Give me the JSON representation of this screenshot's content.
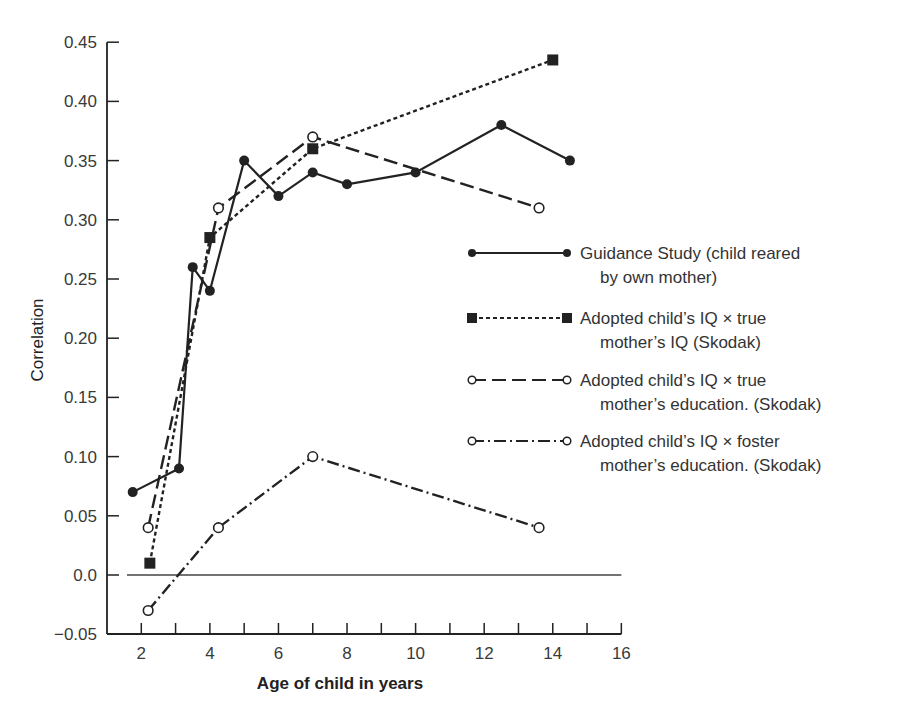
{
  "chart_data": {
    "type": "line",
    "title": "",
    "xlabel": "Age of child in years",
    "ylabel": "Correlation",
    "xlim": [
      1,
      16
    ],
    "ylim": [
      -0.05,
      0.45
    ],
    "x_ticks": [
      2,
      4,
      6,
      8,
      10,
      12,
      14,
      16
    ],
    "x_minor_ticks": [
      2,
      3,
      4,
      5,
      6,
      7,
      8,
      9,
      10,
      11,
      12,
      13,
      14,
      15,
      16
    ],
    "y_ticks": [
      -0.05,
      0.0,
      0.05,
      0.1,
      0.15,
      0.2,
      0.25,
      0.3,
      0.35,
      0.4,
      0.45
    ],
    "y_tick_labels": [
      "−0.05",
      "0.0",
      "0.05",
      "0.10",
      "0.15",
      "0.20",
      "0.25",
      "0.30",
      "0.35",
      "0.40",
      "0.45"
    ],
    "x_tick_labels": [
      "2",
      "4",
      "6",
      "8",
      "10",
      "12",
      "14",
      "16"
    ],
    "grid": false,
    "reference_line": {
      "y": 0.0,
      "style": "solid"
    },
    "legend_position": "right",
    "series": [
      {
        "name": "Guidance Study (child reared by own mother)",
        "legend_lines": [
          "Guidance Study (child reared",
          "by own mother)"
        ],
        "marker": "filled-circle",
        "line_style": "solid",
        "x": [
          1.75,
          3.1,
          3.5,
          4.0,
          5.0,
          6.0,
          7.0,
          8.0,
          10.0,
          12.5,
          14.5
        ],
        "values": [
          0.07,
          0.09,
          0.26,
          0.24,
          0.35,
          0.32,
          0.34,
          0.33,
          0.34,
          0.38,
          0.35
        ]
      },
      {
        "name": "Adopted child's IQ X true mother's IQ (Skodak)",
        "legend_lines": [
          "Adopted child’s IQ × true",
          "mother’s IQ (Skodak)"
        ],
        "marker": "filled-square",
        "line_style": "dotted",
        "x": [
          2.25,
          4.0,
          7.0,
          14.0
        ],
        "values": [
          0.01,
          0.285,
          0.36,
          0.435
        ]
      },
      {
        "name": "Adopted child's IQ X true mother's education. (Skodak)",
        "legend_lines": [
          "Adopted child’s IQ × true",
          "mother’s education. (Skodak)"
        ],
        "marker": "open-circle",
        "line_style": "dashed",
        "x": [
          2.2,
          4.25,
          7.0,
          13.6
        ],
        "values": [
          0.04,
          0.31,
          0.37,
          0.31
        ]
      },
      {
        "name": "Adopted child's IQ X foster mother's education. (Skodak)",
        "legend_lines": [
          "Adopted child’s IQ × foster",
          "mother’s education. (Skodak)"
        ],
        "marker": "open-circle",
        "line_style": "dash-dot",
        "x": [
          2.2,
          4.25,
          7.0,
          13.6
        ],
        "values": [
          -0.03,
          0.04,
          0.1,
          0.04
        ]
      }
    ]
  },
  "style": {
    "ink": "#222222",
    "axis": "#333333",
    "background": "#ffffff"
  }
}
